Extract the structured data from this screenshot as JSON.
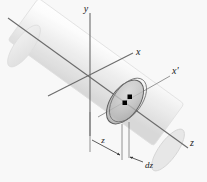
{
  "figure": {
    "background_color": "#f8f8f8",
    "labels": {
      "y_axis": "y",
      "x_axis": "x",
      "x_prime_axis": "x'",
      "z_axis": "z",
      "dimension_z": "z",
      "dimension_dz": "dz"
    },
    "colors": {
      "axis_line": "#6b6b6b",
      "cylinder_fill": "#eeeeee",
      "cylinder_edge": "#d8d8d8",
      "disc_fill": "#b9b9b9",
      "disc_edge": "#5a5a5a",
      "marker": "#000000",
      "dimension_line": "#555555",
      "label_text": "#1a1a1a"
    },
    "geometry": {
      "origin_x": 90,
      "origin_y": 77,
      "disc_center_x": 125,
      "disc_center_y": 102,
      "cylinder_angle_deg": 36
    },
    "markers": [
      {
        "name": "disc-center-marker",
        "x": 125,
        "y": 103
      },
      {
        "name": "disc-offset-marker",
        "x": 130,
        "y": 97
      }
    ]
  }
}
